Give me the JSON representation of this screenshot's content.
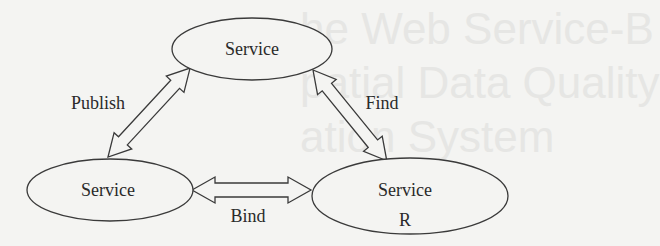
{
  "diagram": {
    "title": "",
    "nodes": [
      {
        "id": "top",
        "label": "Service",
        "sublabel": "",
        "cx": 252,
        "cy": 49,
        "rx": 80,
        "ry": 31
      },
      {
        "id": "left",
        "label": "Service",
        "sublabel": "",
        "cx": 110,
        "cy": 190,
        "rx": 83,
        "ry": 31
      },
      {
        "id": "right",
        "label": "Service",
        "sublabel": "R",
        "cx": 410,
        "cy": 196,
        "rx": 98,
        "ry": 38
      }
    ],
    "edges": [
      {
        "id": "publish",
        "label": "Publish",
        "from": "left",
        "to": "top",
        "bidirectional": true
      },
      {
        "id": "find",
        "label": "Find",
        "from": "top",
        "to": "right",
        "bidirectional": true
      },
      {
        "id": "bind",
        "label": "Bind",
        "from": "left",
        "to": "right",
        "bidirectional": true
      }
    ]
  },
  "watermark": {
    "lines": [
      "he Web Service-B",
      "patial Data Quality",
      "ation System"
    ]
  },
  "colors": {
    "stroke": "#3a3a3a",
    "fill": "#f4f4f2",
    "text": "#2a2a2a"
  }
}
